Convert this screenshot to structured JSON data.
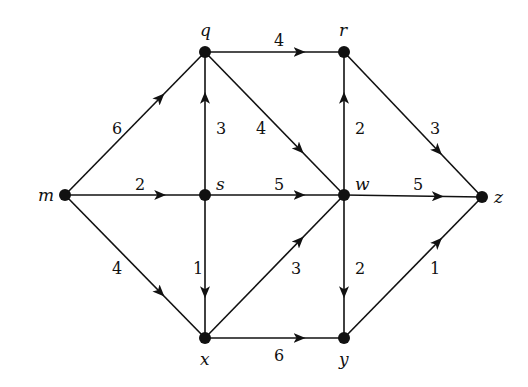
{
  "diagram": {
    "type": "directed-weighted-graph",
    "nodes": [
      {
        "id": "m",
        "label": "m",
        "x": 65,
        "y": 195,
        "lx": 38,
        "ly": 201
      },
      {
        "id": "q",
        "label": "q",
        "x": 205,
        "y": 52,
        "lx": 200,
        "ly": 36
      },
      {
        "id": "r",
        "label": "r",
        "x": 344,
        "y": 52,
        "lx": 339,
        "ly": 36
      },
      {
        "id": "s",
        "label": "s",
        "x": 205,
        "y": 195,
        "lx": 216,
        "ly": 190
      },
      {
        "id": "w",
        "label": "w",
        "x": 344,
        "y": 195,
        "lx": 355,
        "ly": 190
      },
      {
        "id": "z",
        "label": "z",
        "x": 482,
        "y": 197,
        "lx": 494,
        "ly": 203
      },
      {
        "id": "x",
        "label": "x",
        "x": 205,
        "y": 338,
        "lx": 200,
        "ly": 365
      },
      {
        "id": "y",
        "label": "y",
        "x": 344,
        "y": 338,
        "lx": 339,
        "ly": 365
      }
    ],
    "edges": [
      {
        "from": "m",
        "to": "q",
        "weight": "6",
        "lx": 112,
        "ly": 134
      },
      {
        "from": "m",
        "to": "s",
        "weight": "2",
        "lx": 135,
        "ly": 190
      },
      {
        "from": "m",
        "to": "x",
        "weight": "4",
        "lx": 112,
        "ly": 274
      },
      {
        "from": "s",
        "to": "q",
        "weight": "3",
        "lx": 216,
        "ly": 134
      },
      {
        "from": "q",
        "to": "r",
        "weight": "4",
        "lx": 274,
        "ly": 46
      },
      {
        "from": "q",
        "to": "w",
        "weight": "4",
        "lx": 256,
        "ly": 134
      },
      {
        "from": "s",
        "to": "w",
        "weight": "5",
        "lx": 274,
        "ly": 190
      },
      {
        "from": "s",
        "to": "x",
        "weight": "1",
        "lx": 193,
        "ly": 274
      },
      {
        "from": "w",
        "to": "r",
        "weight": "2",
        "lx": 355,
        "ly": 134
      },
      {
        "from": "r",
        "to": "z",
        "weight": "3",
        "lx": 430,
        "ly": 134
      },
      {
        "from": "w",
        "to": "z",
        "weight": "5",
        "lx": 413,
        "ly": 190
      },
      {
        "from": "x",
        "to": "w",
        "weight": "3",
        "lx": 291,
        "ly": 274
      },
      {
        "from": "w",
        "to": "y",
        "weight": "2",
        "lx": 355,
        "ly": 274
      },
      {
        "from": "x",
        "to": "y",
        "weight": "6",
        "lx": 274,
        "ly": 361
      },
      {
        "from": "y",
        "to": "z",
        "weight": "1",
        "lx": 430,
        "ly": 274
      }
    ]
  }
}
